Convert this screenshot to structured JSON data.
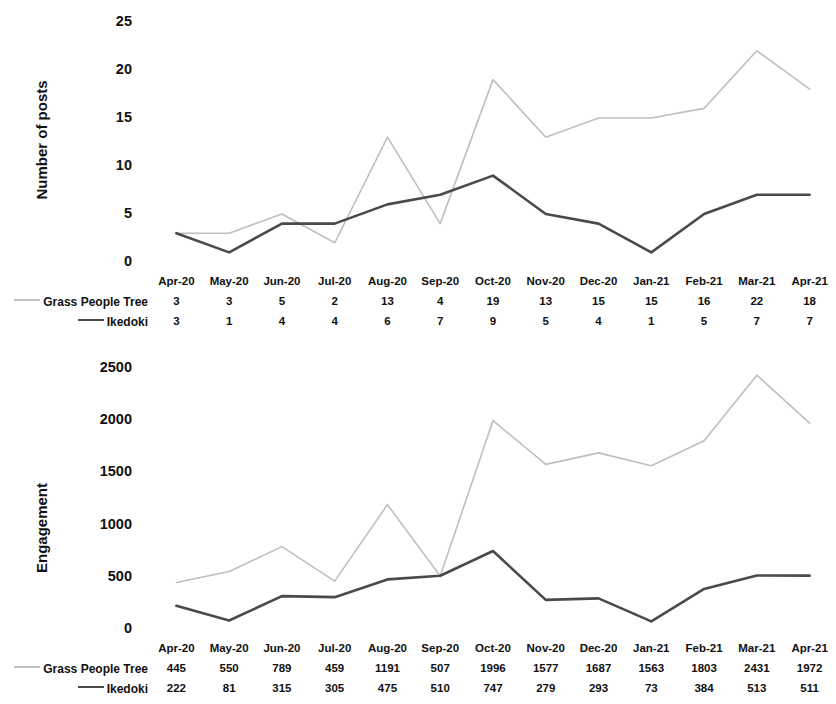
{
  "chart_data": [
    {
      "type": "line",
      "title": "",
      "ylabel": "Number of posts",
      "xlabel": "",
      "categories": [
        "Apr-20",
        "May-20",
        "Jun-20",
        "Jul-20",
        "Aug-20",
        "Sep-20",
        "Oct-20",
        "Nov-20",
        "Dec-20",
        "Jan-21",
        "Feb-21",
        "Mar-21",
        "Apr-21"
      ],
      "yticks": [
        0,
        5,
        10,
        15,
        20,
        25
      ],
      "ylim": [
        0,
        25
      ],
      "grid": false,
      "legend_position": "bottom-table",
      "series": [
        {
          "name": "Grass People Tree",
          "color": "#bfbfbf",
          "values": [
            3,
            3,
            5,
            2,
            13,
            4,
            19,
            13,
            15,
            15,
            16,
            22,
            18
          ]
        },
        {
          "name": "Ikedoki",
          "color": "#4a4a4a",
          "values": [
            3,
            1,
            4,
            4,
            6,
            7,
            9,
            5,
            4,
            1,
            5,
            7,
            7
          ]
        }
      ]
    },
    {
      "type": "line",
      "title": "",
      "ylabel": "Engagement",
      "xlabel": "",
      "categories": [
        "Apr-20",
        "May-20",
        "Jun-20",
        "Jul-20",
        "Aug-20",
        "Sep-20",
        "Oct-20",
        "Nov-20",
        "Dec-20",
        "Jan-21",
        "Feb-21",
        "Mar-21",
        "Apr-21"
      ],
      "yticks": [
        0,
        500,
        1000,
        1500,
        2000,
        2500
      ],
      "ylim": [
        0,
        2500
      ],
      "grid": false,
      "legend_position": "bottom-table",
      "series": [
        {
          "name": "Grass People Tree",
          "color": "#bfbfbf",
          "values": [
            445,
            550,
            789,
            459,
            1191,
            507,
            1996,
            1577,
            1687,
            1563,
            1803,
            2431,
            1972
          ]
        },
        {
          "name": "Ikedoki",
          "color": "#4a4a4a",
          "values": [
            222,
            81,
            315,
            305,
            475,
            510,
            747,
            279,
            293,
            73,
            384,
            513,
            511
          ]
        }
      ]
    }
  ]
}
